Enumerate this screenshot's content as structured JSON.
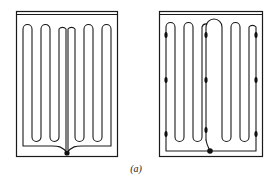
{
  "figure": {
    "caption": "(a)",
    "panels": [
      {
        "id": "left",
        "description": "serpentine heating element, single central connection at bottom",
        "loops": 6,
        "junction_nodes": 1
      },
      {
        "id": "right",
        "description": "serpentine heating element with intermediate tap points",
        "loops": 6,
        "junction_nodes": 1,
        "tap_nodes": 10
      }
    ]
  }
}
